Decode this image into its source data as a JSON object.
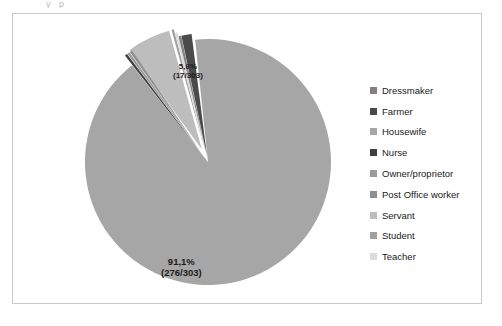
{
  "figure": {
    "crop_remnant": "y  p",
    "frame_border_color": "#c9c9c9",
    "background_color": "#ffffff"
  },
  "chart_data": {
    "type": "pie",
    "title": "",
    "total": 303,
    "units": "persons",
    "legend_position": "right",
    "exploded": true,
    "categories": [
      "Dressmaker",
      "Farmer",
      "Housewife",
      "Nurse",
      "Owner/proprietor",
      "Post Office worker",
      "Servant",
      "Student",
      "Teacher"
    ],
    "values": [
      1,
      4,
      276,
      1,
      1,
      1,
      17,
      1,
      1
    ],
    "percentages": [
      0.3,
      1.3,
      91.1,
      0.3,
      0.3,
      0.3,
      5.6,
      0.3,
      0.3
    ],
    "colors": [
      "#808080",
      "#4a4a4a",
      "#a6a6a6",
      "#3f3f3f",
      "#9b9b9b",
      "#8f8f8f",
      "#bdbdbd",
      "#a0a0a0",
      "#dcdcdc"
    ],
    "data_labels": [
      {
        "category": "Housewife",
        "percent_text": "91,1%",
        "fraction_text": "(276/303)"
      },
      {
        "category": "Servant",
        "percent_text": "5,6%",
        "fraction_text": "(17/303)"
      }
    ],
    "slice_geometry": [
      {
        "name": "Servant",
        "start_deg": -36.0,
        "end_deg": -15.5,
        "color": "#bdbdbd",
        "offset": 14
      },
      {
        "name": "Student",
        "start_deg": -15.5,
        "end_deg": -14.4,
        "color": "#a0a0a0",
        "offset": 14
      },
      {
        "name": "Teacher",
        "start_deg": -14.4,
        "end_deg": -13.2,
        "color": "#dcdcdc",
        "offset": 10
      },
      {
        "name": "Dressmaker",
        "start_deg": -13.2,
        "end_deg": -12.0,
        "color": "#808080",
        "offset": 6
      },
      {
        "name": "Farmer",
        "start_deg": -12.0,
        "end_deg": -7.2,
        "color": "#4a4a4a",
        "offset": 6
      },
      {
        "name": "Housewife",
        "start_deg": -6.0,
        "end_deg": 321.9,
        "color": "#a6a6a6",
        "offset": 0
      },
      {
        "name": "Nurse",
        "start_deg": 322.0,
        "end_deg": 323.2,
        "color": "#3f3f3f",
        "offset": 12
      },
      {
        "name": "Owner/proprietor",
        "start_deg": 323.3,
        "end_deg": 324.5,
        "color": "#9b9b9b",
        "offset": 12
      },
      {
        "name": "Post Office worker",
        "start_deg": 324.6,
        "end_deg": 325.8,
        "color": "#8f8f8f",
        "offset": 12
      }
    ]
  }
}
